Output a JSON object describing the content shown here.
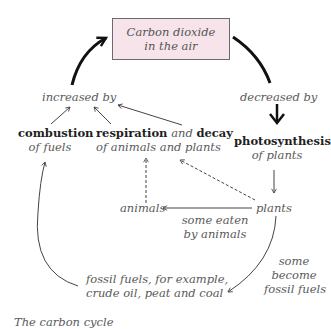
{
  "diagram": {
    "title_partial": "The carbon cycle",
    "center_box": {
      "line1": "Carbon dioxide",
      "line2": "in the air",
      "fill": "#f7e4ea"
    },
    "left_branch": {
      "label": "increased by",
      "combustion": {
        "bold": "combustion",
        "sub": "of fuels"
      },
      "respiration": {
        "bold1": "respiration",
        "and": " and ",
        "bold2": "decay",
        "sub": "of animals and plants"
      }
    },
    "right_branch": {
      "label": "decreased by",
      "photosynthesis": {
        "bold": "photosynthesis",
        "sub": "of plants"
      }
    },
    "lower": {
      "animals": "animals",
      "plants": "plants",
      "eaten_line1": "some eaten",
      "eaten_line2": "by animals",
      "fossil_line1": "fossil fuels, for example,",
      "fossil_line2": "crude oil, peat and coal",
      "become_line1": "some",
      "become_line2": "become",
      "become_line3": "fossil fuels"
    }
  }
}
